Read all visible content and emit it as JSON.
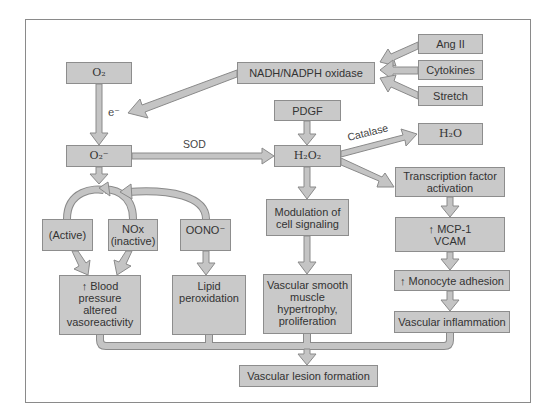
{
  "diagram": {
    "boxes": {
      "o2": "O₂",
      "nadh": "NADH/NADPH oxidase",
      "ang2": "Ang II",
      "cytokines": "Cytokines",
      "stretch": "Stretch",
      "pdgf": "PDGF",
      "o2_minus": "O₂⁻",
      "h2o2": "H₂O₂",
      "h2o": "H₂O",
      "active": "(Active)",
      "nox": "NOx\n(inactive)",
      "oono": "OONO⁻",
      "modulation": "Modulation of\ncell signaling",
      "transcription": "Transcription factor\nactivation",
      "mcp1": "↑ MCP-1\n  VCAM",
      "blood_pressure": "↑ Blood\npressure\naltered\nvasoreactivity",
      "lipid": "Lipid\nperoxidation",
      "vsm": "Vascular smooth\nmuscle\nhypertrophy,\nproliferation",
      "monocyte": "↑ Monocyte adhesion",
      "inflammation": "Vascular inflammation",
      "lesion": "Vascular lesion formation"
    },
    "edge_labels": {
      "electron": "e⁻",
      "sod": "SOD",
      "catalase": "Catalase"
    },
    "colors": {
      "box_fill": "#c9c9c9",
      "box_border": "#8d8d8d",
      "arrow_fill": "#c4c4c4",
      "arrow_stroke": "#8a8a8a"
    }
  }
}
